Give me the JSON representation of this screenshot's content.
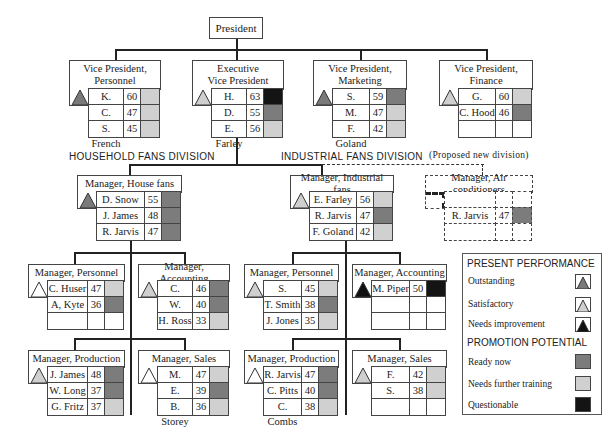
{
  "colors": {
    "outstanding": "#7a7a7a",
    "satisfactory": "#cfcfcf",
    "needs_improvement": "#111111",
    "ready_now": "#7c7c7c",
    "needs_training": "#d0d0d0",
    "questionable": "#141414",
    "line": "#222222"
  },
  "president": {
    "title": "President"
  },
  "divisions": {
    "household": "HOUSEHOLD FANS DIVISION",
    "industrial": "INDUSTRIAL FANS DIVISION",
    "proposed": "(Proposed new division)"
  },
  "positions": [
    {
      "id": "vp_personnel",
      "title_line1": "Vice President,",
      "title_line2": "Personnel",
      "performance": "outstanding",
      "people": [
        {
          "name": "K. Addison",
          "age": "60",
          "potential": "needs_training"
        },
        {
          "name": "C. Huser",
          "age": "47",
          "potential": "needs_training"
        },
        {
          "name": "S. French",
          "age": "45",
          "potential": "needs_training"
        }
      ]
    },
    {
      "id": "evp",
      "title_line1": "Executive",
      "title_line2": "Vice President",
      "performance": "satisfactory",
      "people": [
        {
          "name": "H. Grady",
          "age": "63",
          "potential": "questionable"
        },
        {
          "name": "D. Snow",
          "age": "55",
          "potential": "ready_now"
        },
        {
          "name": "E. Farley",
          "age": "56",
          "potential": "needs_training"
        }
      ]
    },
    {
      "id": "vp_marketing",
      "title_line1": "Vice President,",
      "title_line2": "Marketing",
      "performance": "outstanding",
      "people": [
        {
          "name": "S. Morrow",
          "age": "59",
          "potential": "ready_now"
        },
        {
          "name": "M. Murray",
          "age": "47",
          "potential": "needs_training"
        },
        {
          "name": "F. Goland",
          "age": "42",
          "potential": "needs_training"
        }
      ]
    },
    {
      "id": "vp_finance",
      "title_line1": "Vice President,",
      "title_line2": "Finance",
      "performance": "satisfactory",
      "people": [
        {
          "name": "G. Sleight",
          "age": "60",
          "potential": "needs_training"
        },
        {
          "name": "C. Hood",
          "age": "46",
          "potential": "ready_now"
        },
        {
          "name": "",
          "age": "",
          "potential": "none"
        }
      ]
    },
    {
      "id": "mgr_house_fans",
      "title_line1": "Manager, House fans",
      "performance": "outstanding",
      "people": [
        {
          "name": "D. Snow",
          "age": "55",
          "potential": "ready_now"
        },
        {
          "name": "J. James",
          "age": "48",
          "potential": "ready_now"
        },
        {
          "name": "R. Jarvis",
          "age": "47",
          "potential": "ready_now"
        }
      ]
    },
    {
      "id": "mgr_industrial_fans",
      "title_line1": "Manager, Industrial fans",
      "performance": "satisfactory",
      "people": [
        {
          "name": "E. Farley",
          "age": "56",
          "potential": "needs_training"
        },
        {
          "name": "R. Jarvis",
          "age": "47",
          "potential": "ready_now"
        },
        {
          "name": "F. Goland",
          "age": "42",
          "potential": "needs_training"
        }
      ]
    },
    {
      "id": "mgr_air_conditioners",
      "title_line1": "Manager, Air conditioners",
      "performance": "none",
      "proposed": true,
      "people": [
        {
          "name": "",
          "age": "",
          "potential": "none"
        },
        {
          "name": "R. Jarvis",
          "age": "47",
          "potential": "ready_now"
        },
        {
          "name": "",
          "age": "",
          "potential": "none"
        }
      ]
    },
    {
      "id": "hh_personnel",
      "title_line1": "Manager, Personnel",
      "performance": "none_outline",
      "people": [
        {
          "name": "C. Huser",
          "age": "47",
          "potential": "needs_training"
        },
        {
          "name": "A, Kyte",
          "age": "36",
          "potential": "ready_now"
        },
        {
          "name": "",
          "age": "",
          "potential": "none"
        }
      ]
    },
    {
      "id": "hh_accounting",
      "title_line1": "Manager, Accounting",
      "performance": "satisfactory",
      "people": [
        {
          "name": "C. Hood",
          "age": "46",
          "potential": "ready_now"
        },
        {
          "name": "W. Wicks",
          "age": "40",
          "potential": "ready_now"
        },
        {
          "name": "H. Ross",
          "age": "33",
          "potential": "needs_training"
        }
      ]
    },
    {
      "id": "ind_personnel",
      "title_line1": "Manager, Personnel",
      "performance": "satisfactory",
      "people": [
        {
          "name": "S. French",
          "age": "45",
          "potential": "needs_training"
        },
        {
          "name": "T. Smith",
          "age": "38",
          "potential": "ready_now"
        },
        {
          "name": "J. Jones",
          "age": "35",
          "potential": "needs_training"
        }
      ]
    },
    {
      "id": "ind_accounting",
      "title_line1": "Manager, Accounting",
      "performance": "needs_improvement",
      "people": [
        {
          "name": "M. Piper",
          "age": "50",
          "potential": "questionable"
        },
        {
          "name": "",
          "age": "",
          "potential": "none"
        },
        {
          "name": "",
          "age": "",
          "potential": "none"
        }
      ]
    },
    {
      "id": "hh_production",
      "title_line1": "Manager, Production",
      "performance": "satisfactory",
      "people": [
        {
          "name": "J. James",
          "age": "48",
          "potential": "ready_now"
        },
        {
          "name": "W. Long",
          "age": "37",
          "potential": "ready_now"
        },
        {
          "name": "G. Fritz",
          "age": "37",
          "potential": "needs_training"
        }
      ]
    },
    {
      "id": "hh_sales",
      "title_line1": "Manager, Sales",
      "performance": "none_outline",
      "people": [
        {
          "name": "M. Murray",
          "age": "47",
          "potential": "needs_training"
        },
        {
          "name": "E. Renfrew",
          "age": "39",
          "potential": "ready_now"
        },
        {
          "name": "B. Storey",
          "age": "36",
          "potential": "needs_training"
        }
      ]
    },
    {
      "id": "ind_production",
      "title_line1": "Manager, Production",
      "performance": "none_outline",
      "people": [
        {
          "name": "R. Jarvis",
          "age": "47",
          "potential": "ready_now"
        },
        {
          "name": "C. Pitts",
          "age": "40",
          "potential": "ready_now"
        },
        {
          "name": "C. Combs",
          "age": "38",
          "potential": "needs_training"
        }
      ]
    },
    {
      "id": "ind_sales",
      "title_line1": "Manager, Sales",
      "performance": "satisfactory",
      "people": [
        {
          "name": "F. Goland",
          "age": "42",
          "potential": "needs_training"
        },
        {
          "name": "S. Ramos",
          "age": "38",
          "potential": "needs_training"
        },
        {
          "name": "",
          "age": "",
          "potential": "none"
        }
      ]
    }
  ],
  "legend": {
    "performance_header": "PRESENT PERFORMANCE",
    "performance_items": [
      {
        "label": "Outstanding",
        "key": "outstanding"
      },
      {
        "label": "Satisfactory",
        "key": "satisfactory"
      },
      {
        "label": "Needs improvement",
        "key": "needs_improvement"
      }
    ],
    "potential_header": "PROMOTION POTENTIAL",
    "potential_items": [
      {
        "label": "Ready now",
        "key": "ready_now"
      },
      {
        "label": "Needs further training",
        "key": "needs_training"
      },
      {
        "label": "Questionable",
        "key": "questionable"
      }
    ]
  }
}
